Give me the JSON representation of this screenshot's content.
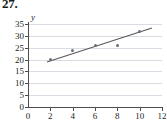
{
  "exercise": {
    "number": "27."
  },
  "chart_data": {
    "type": "scatter",
    "title": "",
    "xlabel": "",
    "ylabel": "y",
    "xlim": [
      0,
      12
    ],
    "ylim": [
      0,
      35
    ],
    "grid": true,
    "legend": false,
    "xticks": [
      0,
      2,
      4,
      6,
      8,
      10,
      12
    ],
    "xtick_labels": [
      "0",
      "2",
      "4",
      "6",
      "8",
      "10",
      "12"
    ],
    "yticks": [
      0,
      5,
      10,
      15,
      20,
      25,
      30,
      35
    ],
    "ytick_labels": [
      "0",
      "5",
      "10",
      "15",
      "20",
      "25",
      "30",
      "35"
    ],
    "series": [
      {
        "name": "data points",
        "type": "scatter",
        "marker": "circle",
        "color": "#6e6e76",
        "points": [
          {
            "x": 2,
            "y": 20
          },
          {
            "x": 4,
            "y": 24
          },
          {
            "x": 6,
            "y": 26
          },
          {
            "x": 8,
            "y": 26
          },
          {
            "x": 10,
            "y": 32
          }
        ]
      },
      {
        "name": "trend line",
        "type": "line",
        "color": "#58585b",
        "points": [
          {
            "x": 1.7,
            "y": 19
          },
          {
            "x": 11.1,
            "y": 33.3
          }
        ]
      }
    ],
    "colors": {
      "marker": "#6e6e76",
      "trendline": "#58585b",
      "gridline": "#d8dde3",
      "axis": "#4d4d4d",
      "text": "#231f20",
      "background": "#ffffff"
    }
  }
}
